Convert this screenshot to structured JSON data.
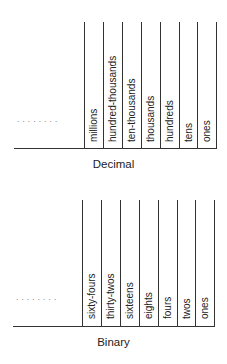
{
  "decimal": {
    "caption": "Decimal",
    "ellipsis": "........",
    "columns": [
      "millions",
      "hundred-thousands",
      "ten-thousands",
      "thousands",
      "hundreds",
      "tens",
      "ones"
    ]
  },
  "binary": {
    "caption": "Binary",
    "ellipsis": "........",
    "columns": [
      "sixty-fours",
      "thirty-twos",
      "sixteens",
      "eights",
      "fours",
      "twos",
      "ones"
    ]
  }
}
